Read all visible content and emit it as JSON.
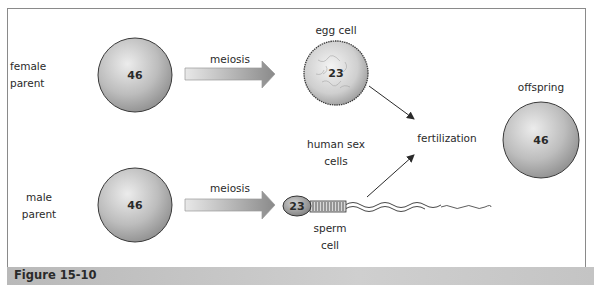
{
  "figure": {
    "caption": "Figure 15-10"
  },
  "female_parent": {
    "label_line1": "female",
    "label_line2": "parent",
    "chromosomes": "46"
  },
  "male_parent": {
    "label_line1": "male",
    "label_line2": "parent",
    "chromosomes": "46"
  },
  "process": {
    "meiosis_top": "meiosis",
    "meiosis_bottom": "meiosis",
    "fertilization": "fertilization"
  },
  "egg_cell": {
    "label": "egg cell",
    "chromosomes": "23"
  },
  "sperm_cell": {
    "label_line1": "sperm",
    "label_line2": "cell",
    "chromosomes": "23"
  },
  "sex_cells": {
    "label_line1": "human sex",
    "label_line2": "cells"
  },
  "offspring": {
    "label": "offspring",
    "chromosomes": "46"
  },
  "colors": {
    "cell_light": "#e6e6e6",
    "cell_dark": "#8c8c8c",
    "arrow_light": "#e2e2e2",
    "arrow_dark": "#8a8a8a",
    "caption_bar": "#c2c2c2"
  }
}
